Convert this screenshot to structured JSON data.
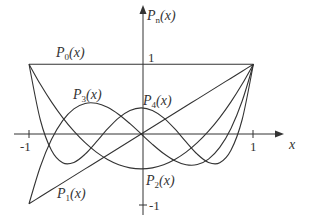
{
  "chart_data": {
    "type": "line",
    "title": "",
    "xlabel": "x",
    "ylabel": "P_n(x)",
    "xlim": [
      -1,
      1
    ],
    "ylim": [
      -1,
      1
    ],
    "grid": false,
    "legend": "inline labels",
    "x_ticks": [
      "-1",
      "1"
    ],
    "y_ticks": [
      "1",
      "-1"
    ],
    "x": [
      -1.0,
      -0.9,
      -0.8,
      -0.7,
      -0.6,
      -0.5,
      -0.4,
      -0.3,
      -0.2,
      -0.1,
      0.0,
      0.1,
      0.2,
      0.3,
      0.4,
      0.5,
      0.6,
      0.7,
      0.8,
      0.9,
      1.0
    ],
    "series": [
      {
        "name": "P0(x)",
        "values": [
          1,
          1,
          1,
          1,
          1,
          1,
          1,
          1,
          1,
          1,
          1,
          1,
          1,
          1,
          1,
          1,
          1,
          1,
          1,
          1,
          1
        ]
      },
      {
        "name": "P1(x)",
        "values": [
          -1,
          -0.9,
          -0.8,
          -0.7,
          -0.6,
          -0.5,
          -0.4,
          -0.3,
          -0.2,
          -0.1,
          0,
          0.1,
          0.2,
          0.3,
          0.4,
          0.5,
          0.6,
          0.7,
          0.8,
          0.9,
          1
        ]
      },
      {
        "name": "P2(x)",
        "values": [
          1,
          0.715,
          0.46,
          0.235,
          0.04,
          -0.125,
          -0.26,
          -0.365,
          -0.44,
          -0.485,
          -0.5,
          -0.485,
          -0.44,
          -0.365,
          -0.26,
          -0.125,
          0.04,
          0.235,
          0.46,
          0.715,
          1
        ]
      },
      {
        "name": "P3(x)",
        "values": [
          -1,
          -0.4725,
          -0.08,
          0.1925,
          0.36,
          0.4375,
          0.44,
          0.3825,
          0.28,
          0.1475,
          0,
          -0.1475,
          -0.28,
          -0.3825,
          -0.44,
          -0.4375,
          -0.36,
          -0.1925,
          0.08,
          0.4725,
          1
        ]
      },
      {
        "name": "P4(x)",
        "values": [
          1,
          0.2079,
          -0.233,
          -0.4121,
          -0.408,
          -0.2891,
          -0.113,
          0.0729,
          0.232,
          0.3379,
          0.375,
          0.3379,
          0.232,
          0.0729,
          -0.113,
          -0.2891,
          -0.408,
          -0.4121,
          -0.233,
          0.2079,
          1
        ]
      }
    ],
    "labels": {
      "P0": "P0(x)",
      "P1": "P1(x)",
      "P2": "P2(x)",
      "P3": "P3(x)",
      "P4": "P4(x)",
      "Pn": "Pn(x)"
    },
    "line_color": "#333333"
  },
  "labels": {
    "yaxis": {
      "main": "P",
      "sub": "n",
      "arg": "(x)"
    },
    "p0": {
      "main": "P",
      "sub": "0",
      "arg": "(x)"
    },
    "p1": {
      "main": "P",
      "sub": "1",
      "arg": "(x)"
    },
    "p2": {
      "main": "P",
      "sub": "2",
      "arg": "(x)"
    },
    "p3": {
      "main": "P",
      "sub": "3",
      "arg": "(x)"
    },
    "p4": {
      "main": "P",
      "sub": "4",
      "arg": "(x)"
    },
    "xaxis": "x",
    "tick_y_pos": "1",
    "tick_y_neg": "-1",
    "tick_x_neg": "-1",
    "tick_x_pos": "1"
  }
}
